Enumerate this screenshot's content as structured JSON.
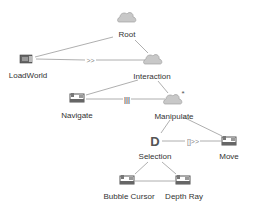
{
  "diagram": {
    "type": "task-tree",
    "nodes": [
      {
        "id": "root",
        "label": "Root",
        "icon": "cloud-icon",
        "x": 127,
        "y": 18,
        "lx": 127,
        "ly": 30
      },
      {
        "id": "loadworld",
        "label": "LoadWorld",
        "icon": "application-icon",
        "x": 26,
        "y": 59,
        "lx": 28,
        "ly": 71
      },
      {
        "id": "interaction",
        "label": "Interaction",
        "icon": "cloud-icon",
        "x": 153,
        "y": 60,
        "lx": 152,
        "ly": 72
      },
      {
        "id": "navigate",
        "label": "Navigate",
        "icon": "interaction-icon",
        "x": 77,
        "y": 98,
        "lx": 77,
        "ly": 111
      },
      {
        "id": "manipulate",
        "label": "Manipulate",
        "icon": "cloud-icon",
        "x": 173,
        "y": 100,
        "lx": 174,
        "ly": 112,
        "badge": "*"
      },
      {
        "id": "selection",
        "label": "Selection",
        "icon": "decision-icon",
        "x": 155,
        "y": 141,
        "lx": 155,
        "ly": 152
      },
      {
        "id": "move",
        "label": "Move",
        "icon": "interaction-icon",
        "x": 229,
        "y": 141,
        "lx": 229,
        "ly": 152
      },
      {
        "id": "bubble_cursor",
        "label": "Bubble Cursor",
        "icon": "interaction-icon",
        "x": 127,
        "y": 180,
        "lx": 129,
        "ly": 192
      },
      {
        "id": "depth_ray",
        "label": "Depth Ray",
        "icon": "interaction-icon",
        "x": 183,
        "y": 180,
        "lx": 184,
        "ly": 192
      }
    ],
    "edges": [
      {
        "from": "root",
        "to": "loadworld",
        "kind": "parent"
      },
      {
        "from": "root",
        "to": "interaction",
        "kind": "parent"
      },
      {
        "from": "loadworld",
        "to": "interaction",
        "kind": "sibling",
        "operator": ">>"
      },
      {
        "from": "interaction",
        "to": "navigate",
        "kind": "parent"
      },
      {
        "from": "interaction",
        "to": "manipulate",
        "kind": "parent"
      },
      {
        "from": "navigate",
        "to": "manipulate",
        "kind": "sibling",
        "operator": "|||"
      },
      {
        "from": "manipulate",
        "to": "selection",
        "kind": "parent"
      },
      {
        "from": "manipulate",
        "to": "move",
        "kind": "parent"
      },
      {
        "from": "selection",
        "to": "move",
        "kind": "sibling",
        "operator": "[]>>"
      },
      {
        "from": "selection",
        "to": "bubble_cursor",
        "kind": "parent"
      },
      {
        "from": "selection",
        "to": "depth_ray",
        "kind": "parent"
      },
      {
        "from": "bubble_cursor",
        "to": "depth_ray",
        "kind": "sibling",
        "operator": ""
      }
    ],
    "operators": {
      "enabling": ">>",
      "concurrent": "|||",
      "enabling_info": "[]>>",
      "iteration_badge": "*",
      "decision_glyph": "D"
    },
    "colors": {
      "line": "#9a9a9a",
      "cloud": "#c8c8c8",
      "cloud_stroke": "#a0a0a0",
      "label": "#333333",
      "icon_dark": "#555555"
    }
  }
}
